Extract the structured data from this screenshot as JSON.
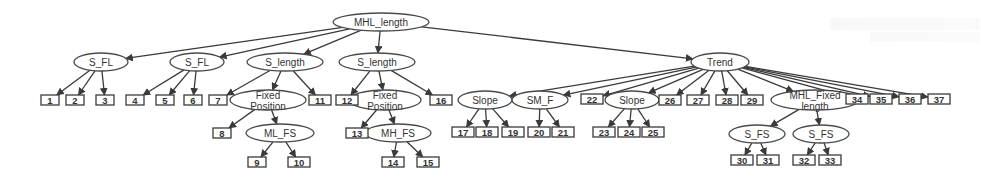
{
  "diagram": {
    "colors": {
      "line": "#3a3a3a",
      "node_fill": "#ffffff",
      "text": "#333333",
      "background": "#ffffff"
    },
    "root": {
      "id": "root",
      "label": "MHL_length",
      "x": 381,
      "y": 22,
      "rx": 48,
      "ry": 9
    },
    "nodes": [
      {
        "id": "sfl1",
        "label": "S_FL",
        "x": 101,
        "y": 62,
        "rx": 27,
        "ry": 9
      },
      {
        "id": "sfl2",
        "label": "S_FL",
        "x": 197,
        "y": 62,
        "rx": 27,
        "ry": 9
      },
      {
        "id": "slen1",
        "label": "S_length",
        "x": 285,
        "y": 62,
        "rx": 38,
        "ry": 9
      },
      {
        "id": "slen2",
        "label": "S_length",
        "x": 377,
        "y": 62,
        "rx": 38,
        "ry": 9
      },
      {
        "id": "trend",
        "label": "Trend",
        "x": 720,
        "y": 62,
        "rx": 29,
        "ry": 9
      },
      {
        "id": "fixpos1",
        "label": "Fixed Position",
        "x": 268,
        "y": 100,
        "rx": 38,
        "ry": 10
      },
      {
        "id": "fixpos2",
        "label": "Fixed Position",
        "x": 385,
        "y": 100,
        "rx": 36,
        "ry": 10
      },
      {
        "id": "slope1",
        "label": "Slope",
        "x": 485,
        "y": 100,
        "rx": 27,
        "ry": 9
      },
      {
        "id": "smf",
        "label": "SM_F",
        "x": 540,
        "y": 100,
        "rx": 28,
        "ry": 9
      },
      {
        "id": "slope2",
        "label": "Slope",
        "x": 632,
        "y": 100,
        "rx": 27,
        "ry": 9
      },
      {
        "id": "mhlfixed",
        "label": "MHL_Fixed length",
        "x": 815,
        "y": 100,
        "rx": 44,
        "ry": 10
      },
      {
        "id": "mlfs",
        "label": "ML_FS",
        "x": 280,
        "y": 133,
        "rx": 34,
        "ry": 9
      },
      {
        "id": "mhfs",
        "label": "MH_FS",
        "x": 398,
        "y": 133,
        "rx": 33,
        "ry": 9
      },
      {
        "id": "sfs1",
        "label": "S_FS",
        "x": 757,
        "y": 134,
        "rx": 28,
        "ry": 9
      },
      {
        "id": "sfs2",
        "label": "S_FS",
        "x": 821,
        "y": 134,
        "rx": 28,
        "ry": 9
      }
    ],
    "leaves": [
      {
        "label": "1",
        "x": 50,
        "y": 100,
        "parent": "sfl1"
      },
      {
        "label": "2",
        "x": 75,
        "y": 100,
        "parent": "sfl1"
      },
      {
        "label": "3",
        "x": 105,
        "y": 100,
        "parent": "sfl1"
      },
      {
        "label": "4",
        "x": 135,
        "y": 100,
        "parent": "sfl2"
      },
      {
        "label": "5",
        "x": 165,
        "y": 100,
        "parent": "sfl2"
      },
      {
        "label": "6",
        "x": 193,
        "y": 100,
        "parent": "sfl2"
      },
      {
        "label": "7",
        "x": 218,
        "y": 100,
        "parent": "slen1"
      },
      {
        "label": "8",
        "x": 222,
        "y": 133,
        "parent": "fixpos1"
      },
      {
        "label": "9",
        "x": 257,
        "y": 162,
        "parent": "mlfs"
      },
      {
        "label": "10",
        "x": 299,
        "y": 162,
        "parent": "mlfs"
      },
      {
        "label": "11",
        "x": 320,
        "y": 100,
        "parent": "slen1"
      },
      {
        "label": "12",
        "x": 347,
        "y": 100,
        "parent": "slen2"
      },
      {
        "label": "13",
        "x": 357,
        "y": 133,
        "parent": "fixpos2"
      },
      {
        "label": "14",
        "x": 393,
        "y": 162,
        "parent": "mhfs"
      },
      {
        "label": "15",
        "x": 428,
        "y": 162,
        "parent": "mhfs"
      },
      {
        "label": "16",
        "x": 441,
        "y": 100,
        "parent": "slen2"
      },
      {
        "label": "17",
        "x": 463,
        "y": 132,
        "parent": "slope1"
      },
      {
        "label": "18",
        "x": 487,
        "y": 132,
        "parent": "slope1"
      },
      {
        "label": "19",
        "x": 513,
        "y": 132,
        "parent": "slope1"
      },
      {
        "label": "20",
        "x": 539,
        "y": 132,
        "parent": "smf"
      },
      {
        "label": "21",
        "x": 563,
        "y": 132,
        "parent": "smf"
      },
      {
        "label": "22",
        "x": 592,
        "y": 99,
        "parent": "trend"
      },
      {
        "label": "23",
        "x": 604,
        "y": 132,
        "parent": "slope2"
      },
      {
        "label": "24",
        "x": 629,
        "y": 132,
        "parent": "slope2"
      },
      {
        "label": "25",
        "x": 653,
        "y": 132,
        "parent": "slope2"
      },
      {
        "label": "26",
        "x": 670,
        "y": 100,
        "parent": "trend"
      },
      {
        "label": "27",
        "x": 698,
        "y": 100,
        "parent": "trend"
      },
      {
        "label": "28",
        "x": 727,
        "y": 100,
        "parent": "trend"
      },
      {
        "label": "29",
        "x": 752,
        "y": 100,
        "parent": "trend"
      },
      {
        "label": "30",
        "x": 742,
        "y": 160,
        "parent": "sfs1"
      },
      {
        "label": "31",
        "x": 768,
        "y": 160,
        "parent": "sfs1"
      },
      {
        "label": "32",
        "x": 804,
        "y": 160,
        "parent": "sfs2"
      },
      {
        "label": "33",
        "x": 830,
        "y": 160,
        "parent": "sfs2"
      },
      {
        "label": "34",
        "x": 857,
        "y": 99,
        "parent": "trend"
      },
      {
        "label": "35",
        "x": 881,
        "y": 99,
        "parent": "trend"
      },
      {
        "label": "36",
        "x": 910,
        "y": 99,
        "parent": "trend"
      },
      {
        "label": "37",
        "x": 939,
        "y": 99,
        "parent": "trend"
      }
    ],
    "edges": [
      [
        "root",
        "sfl1"
      ],
      [
        "root",
        "sfl2"
      ],
      [
        "root",
        "slen1"
      ],
      [
        "root",
        "slen2"
      ],
      [
        "root",
        "trend"
      ],
      [
        "slen1",
        "fixpos1"
      ],
      [
        "fixpos1",
        "mlfs"
      ],
      [
        "slen2",
        "fixpos2"
      ],
      [
        "fixpos2",
        "mhfs"
      ],
      [
        "trend",
        "slope1"
      ],
      [
        "trend",
        "smf"
      ],
      [
        "trend",
        "slope2"
      ],
      [
        "trend",
        "mhlfixed"
      ],
      [
        "mhlfixed",
        "sfs1"
      ],
      [
        "mhlfixed",
        "sfs2"
      ]
    ]
  }
}
